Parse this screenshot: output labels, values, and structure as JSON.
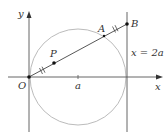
{
  "diagram": {
    "labels": {
      "y_axis": "y",
      "x_axis": "x",
      "origin": "O",
      "point_a_tick": "a",
      "point_P": "P",
      "point_A": "A",
      "point_B": "B",
      "line_eq": "x = 2a"
    },
    "colors": {
      "axis": "#555555",
      "circle": "#b0b0b0",
      "line": "#444444",
      "point": "#111111",
      "text": "#333333"
    },
    "geometry": {
      "origin_px": [
        29,
        77
      ],
      "circle_center_px": [
        78,
        77
      ],
      "circle_radius_px": 48,
      "vertical_line_x_px": 127,
      "B_px": [
        127,
        24
      ],
      "A_px": [
        104,
        36
      ],
      "P_px": [
        54,
        63
      ],
      "a_tick_x_px": 78
    }
  }
}
